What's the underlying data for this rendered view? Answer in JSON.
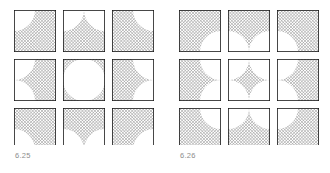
{
  "page": {
    "background_color": "#ffffff",
    "width": 330,
    "height": 173
  },
  "style": {
    "hatch_color": "#9a9a9a",
    "hatch_background": "#ffffff",
    "outline_color": "#1a1a1a",
    "caption_color": "#8d8d8d",
    "hatch_spacing_px": 2.2,
    "hatch_line_width_px": 0.9,
    "outline_width_px": 1.6
  },
  "figures": [
    {
      "id": "625",
      "caption": "6.25",
      "grid": {
        "rows": 3,
        "cols": 3,
        "cell_size_px": 42,
        "gap_px": 7,
        "origin_x_px": 14,
        "origin_y_px": 10
      },
      "description": "Three-by-three grid of squares; hatched ground with inscribed white circular figures bulging toward each cell centre, leaving concave hatched corner fillets.",
      "pattern": "figure-white-ground-hatched",
      "circle_radius_ratio": 0.5,
      "cells": [
        {
          "row": 0,
          "col": 0,
          "white_arcs": [
            "top-left"
          ],
          "hatched_corner": "bottom-right"
        },
        {
          "row": 0,
          "col": 1,
          "white_arcs": [
            "top-left",
            "top-right"
          ],
          "hatched_corner": "bottom-center"
        },
        {
          "row": 0,
          "col": 2,
          "white_arcs": [
            "top-right"
          ],
          "hatched_corner": "bottom-left"
        },
        {
          "row": 1,
          "col": 0,
          "white_arcs": [
            "top-left",
            "bottom-left"
          ],
          "hatched_corner": "right-center"
        },
        {
          "row": 1,
          "col": 1,
          "white_arcs": [
            "full-circle"
          ],
          "hatched_corner": "all-four"
        },
        {
          "row": 1,
          "col": 2,
          "white_arcs": [
            "top-right",
            "bottom-right"
          ],
          "hatched_corner": "left-center"
        },
        {
          "row": 2,
          "col": 0,
          "white_arcs": [
            "bottom-left"
          ],
          "hatched_corner": "top-right"
        },
        {
          "row": 2,
          "col": 1,
          "white_arcs": [
            "bottom-left",
            "bottom-right"
          ],
          "hatched_corner": "top-center"
        },
        {
          "row": 2,
          "col": 2,
          "white_arcs": [
            "bottom-right"
          ],
          "hatched_corner": "top-left"
        }
      ]
    },
    {
      "id": "626",
      "caption": "6.26",
      "grid": {
        "rows": 3,
        "cols": 3,
        "cell_size_px": 42,
        "gap_px": 7,
        "origin_x_px": 14,
        "origin_y_px": 10
      },
      "description": "Three-by-three grid of squares; inverse of 6.25 — hatched figures form astroid and lens shapes while white quarter-circles occupy the corners facing the grid centre.",
      "pattern": "figure-hatched-ground-white",
      "circle_radius_ratio": 0.5,
      "cells": [
        {
          "row": 0,
          "col": 0,
          "white_quarters": [
            "bottom-right"
          ]
        },
        {
          "row": 0,
          "col": 1,
          "white_quarters": [
            "bottom-left",
            "bottom-right"
          ]
        },
        {
          "row": 0,
          "col": 2,
          "white_quarters": [
            "bottom-left"
          ]
        },
        {
          "row": 1,
          "col": 0,
          "white_quarters": [
            "top-right",
            "bottom-right"
          ]
        },
        {
          "row": 1,
          "col": 1,
          "white_quarters": [
            "top-left",
            "top-right",
            "bottom-left",
            "bottom-right"
          ]
        },
        {
          "row": 1,
          "col": 2,
          "white_quarters": [
            "top-left",
            "bottom-left"
          ]
        },
        {
          "row": 2,
          "col": 0,
          "white_quarters": [
            "top-right"
          ]
        },
        {
          "row": 2,
          "col": 1,
          "white_quarters": [
            "top-left",
            "top-right"
          ]
        },
        {
          "row": 2,
          "col": 2,
          "white_quarters": [
            "top-left"
          ]
        }
      ]
    }
  ]
}
